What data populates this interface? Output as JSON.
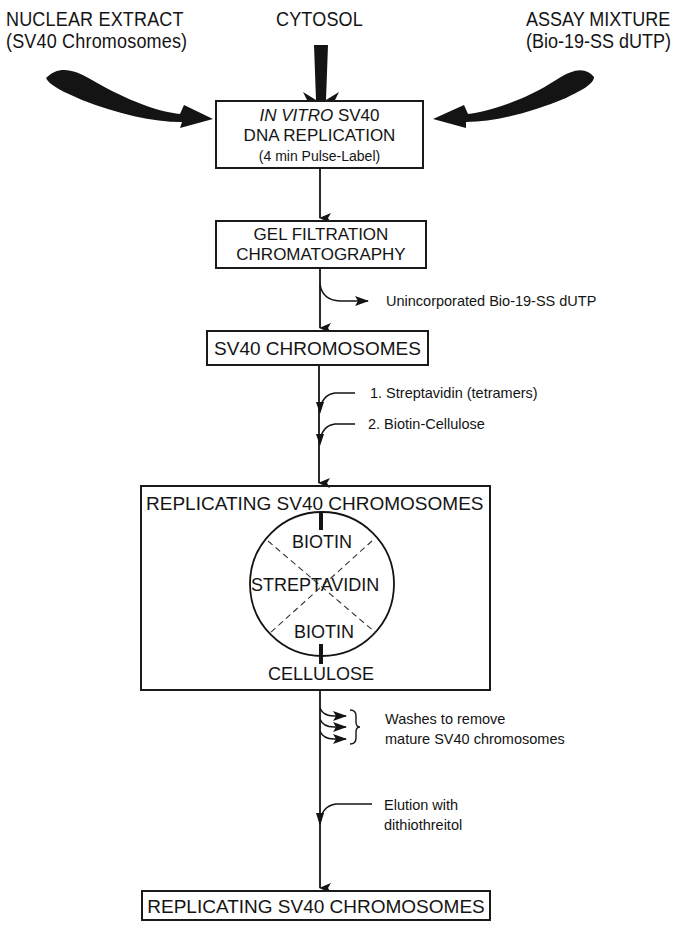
{
  "inputs": {
    "nuclear_extract": {
      "line1": "NUCLEAR EXTRACT",
      "line2": "(SV40 Chromosomes)"
    },
    "cytosol": {
      "line1": "CYTOSOL"
    },
    "assay_mixture": {
      "line1": "ASSAY MIXTURE",
      "line2": "(Bio-19-SS dUTP)"
    }
  },
  "steps": [
    {
      "id": "replication",
      "line1_italic": "IN VITRO",
      "line1_rest": " SV40",
      "line2": "DNA REPLICATION",
      "line3": "(4 min Pulse-Label)"
    },
    {
      "id": "gel",
      "line1": "GEL FILTRATION",
      "line2": "CHROMATOGRAPHY"
    },
    {
      "id": "sv40",
      "line1": "SV40 CHROMOSOMES"
    },
    {
      "id": "replicating_complex",
      "title": "REPLICATING SV40 CHROMOSOMES",
      "circle": {
        "top": "BIOTIN",
        "middle": "STREPTAVIDIN",
        "bottom": "BIOTIN"
      },
      "base": "CELLULOSE"
    },
    {
      "id": "final",
      "line1": "REPLICATING SV40 CHROMOSOMES"
    }
  ],
  "side_labels": {
    "unincorporated": "Unincorporated Bio-19-SS dUTP",
    "streptavidin": "1.  Streptavidin (tetramers)",
    "biotin_cellulose": "2.  Biotin-Cellulose",
    "washes_line1": "Washes to remove",
    "washes_line2": "mature SV40 chromosomes",
    "elution_line1": "Elution with",
    "elution_line2": "dithiothreitol"
  },
  "colors": {
    "ink": "#141414",
    "background": "#ffffff"
  }
}
